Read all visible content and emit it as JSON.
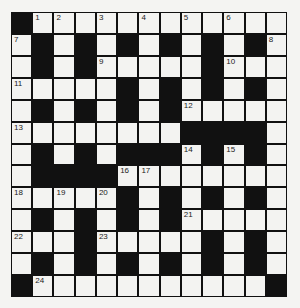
{
  "puzzle": {
    "type": "crossword",
    "rows": 13,
    "cols": 13,
    "colors": {
      "block": "#111111",
      "cell": "#f3f3f1",
      "background": "#f4f4f2"
    },
    "grid": [
      "#............#",
      ".#.#.#.#.#.#.",
      ".#.#.....#...",
      ".....#.#.#.#.",
      ".#.#.#.#.....",
      "........####.",
      ".#.#.###.#.#.",
      ".####........",
      ".....#.#.#.#.",
      ".#.#.#.#.....",
      "...#.....#.#.",
      ".#.#.#.#.#.#.",
      "#...........#"
    ],
    "numbers": [
      {
        "r": 0,
        "c": 1,
        "n": "1"
      },
      {
        "r": 0,
        "c": 2,
        "n": "2"
      },
      {
        "r": 0,
        "c": 4,
        "n": "3"
      },
      {
        "r": 0,
        "c": 6,
        "n": "4"
      },
      {
        "r": 0,
        "c": 8,
        "n": "5"
      },
      {
        "r": 0,
        "c": 10,
        "n": "6"
      },
      {
        "r": 1,
        "c": 0,
        "n": "7"
      },
      {
        "r": 1,
        "c": 12,
        "n": "8"
      },
      {
        "r": 2,
        "c": 4,
        "n": "9"
      },
      {
        "r": 2,
        "c": 10,
        "n": "10"
      },
      {
        "r": 3,
        "c": 0,
        "n": "11"
      },
      {
        "r": 4,
        "c": 8,
        "n": "12"
      },
      {
        "r": 5,
        "c": 0,
        "n": "13"
      },
      {
        "r": 6,
        "c": 8,
        "n": "14"
      },
      {
        "r": 6,
        "c": 10,
        "n": "15"
      },
      {
        "r": 7,
        "c": 5,
        "n": "16"
      },
      {
        "r": 7,
        "c": 6,
        "n": "17"
      },
      {
        "r": 8,
        "c": 0,
        "n": "18"
      },
      {
        "r": 8,
        "c": 2,
        "n": "19"
      },
      {
        "r": 8,
        "c": 4,
        "n": "20"
      },
      {
        "r": 9,
        "c": 8,
        "n": "21"
      },
      {
        "r": 10,
        "c": 0,
        "n": "22"
      },
      {
        "r": 10,
        "c": 4,
        "n": "23"
      },
      {
        "r": 12,
        "c": 1,
        "n": "24"
      }
    ]
  }
}
